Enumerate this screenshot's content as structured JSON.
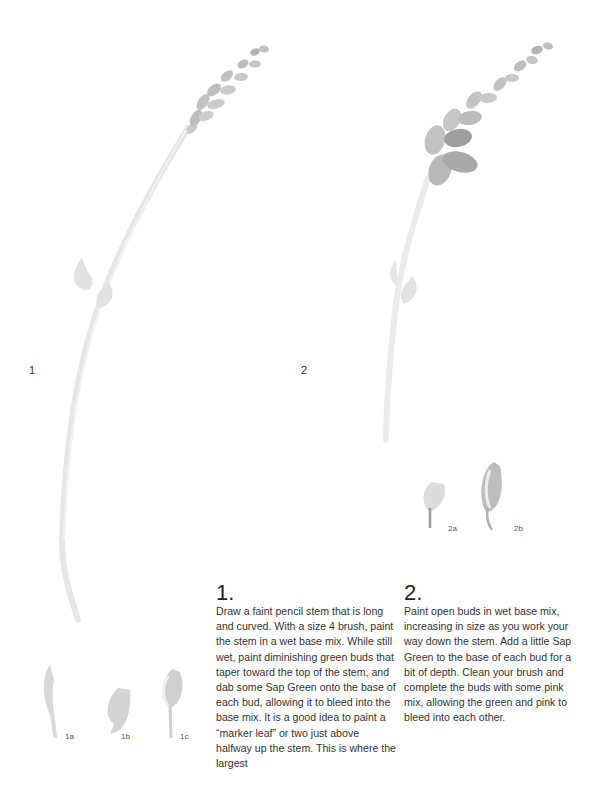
{
  "figures": [
    {
      "id": "1",
      "label": "1",
      "description": "faint pencil stem with painted green buds tapering toward top",
      "sub_figures": [
        {
          "label": "1a",
          "description": "stem segment"
        },
        {
          "label": "1b",
          "description": "bud shape"
        },
        {
          "label": "1c",
          "description": "bud on stem"
        }
      ]
    },
    {
      "id": "2",
      "label": "2",
      "description": "stem with open buds increasing in size down the stem",
      "sub_figures": [
        {
          "label": "2a",
          "description": "small open bud"
        },
        {
          "label": "2b",
          "description": "larger open bud"
        }
      ]
    }
  ],
  "steps": [
    {
      "number": "1.",
      "text": "Draw a faint pencil stem that is long and curved. With a size 4 brush, paint the stem in a wet base mix. While still wet, paint diminishing green buds that taper toward the top of the stem, and dab some Sap Green onto the base of each bud, allowing it to bleed into the base mix. It is a good idea to paint a “marker leaf” or two just above halfway up the stem. This is where the largest"
    },
    {
      "number": "2.",
      "text": "Paint open buds in wet base mix, increasing in size as you work your way down the stem. Add a little Sap Green to the base of each bud for a bit of depth. Clean your brush and complete the buds with some pink mix, allowing the green and pink to bleed into each other."
    }
  ],
  "colors": {
    "stem": "#e4e4e4",
    "bud_light": "#cfcfcf",
    "bud_dark": "#9a9a9a",
    "text": "#333333"
  }
}
